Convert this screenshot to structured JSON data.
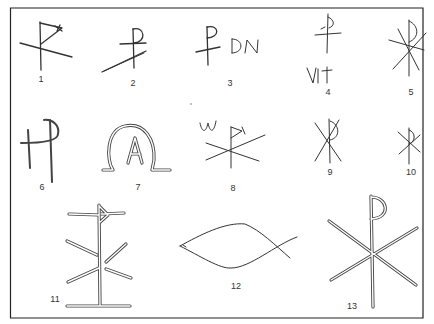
{
  "figure": {
    "frame_color": "#222222",
    "background": "#ffffff",
    "stroke_color": "#333333",
    "labels": [
      {
        "id": 1,
        "text": "1",
        "x": 41,
        "y": 79
      },
      {
        "id": 2,
        "text": "2",
        "x": 133,
        "y": 79
      },
      {
        "id": 3,
        "text": "3",
        "x": 231,
        "y": 79
      },
      {
        "id": 4,
        "text": "4",
        "x": 328,
        "y": 91
      },
      {
        "id": 5,
        "text": "5",
        "x": 411,
        "y": 89
      },
      {
        "id": 6,
        "text": "6",
        "x": 41,
        "y": 186
      },
      {
        "id": 7,
        "text": "7",
        "x": 138,
        "y": 186
      },
      {
        "id": 8,
        "text": "8",
        "x": 232,
        "y": 186
      },
      {
        "id": 9,
        "text": "9",
        "x": 330,
        "y": 170
      },
      {
        "id": 10,
        "text": "10",
        "x": 412,
        "y": 170
      },
      {
        "id": 11,
        "text": "11",
        "x": 54,
        "y": 296
      },
      {
        "id": 12,
        "text": "12",
        "x": 236,
        "y": 283
      },
      {
        "id": 13,
        "text": "13",
        "x": 351,
        "y": 303
      }
    ],
    "inscriptions": {
      "item3": "DN",
      "item4": "VIt",
      "item7": "A",
      "item8": "W"
    }
  }
}
